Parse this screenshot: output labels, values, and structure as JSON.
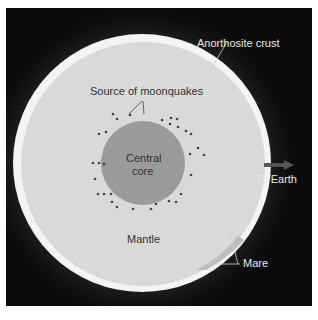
{
  "diagram": {
    "labels": {
      "crust": "Anorthosite crust",
      "moonquakes": "Source of moonquakes",
      "core_line1": "Central",
      "core_line2": "core",
      "mantle": "Mantle",
      "earth": "To Earth",
      "mare": "Mare"
    },
    "colors": {
      "background": "#0b0b0b",
      "crust": "#f4f4f4",
      "mantle": "#d9d9d9",
      "core": "#9a9a9a",
      "label_outer": "#e8e8e8",
      "label_inner": "#333333"
    }
  }
}
